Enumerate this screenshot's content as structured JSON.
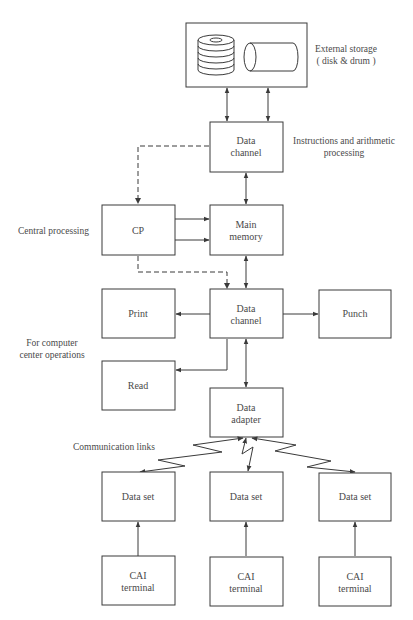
{
  "diagram": {
    "colors": {
      "stroke": "#3a3a3a",
      "text": "#4a4a4a",
      "background": "#ffffff"
    },
    "annotations": {
      "external_storage": [
        "External storage",
        "( disk & drum )"
      ],
      "instructions": [
        "Instructions and arithmetic",
        "processing"
      ],
      "central_processing": "Central processing",
      "computer_center": [
        "For computer",
        "center operations"
      ],
      "communication_links": "Communication links"
    },
    "nodes": {
      "storage": {
        "label": "External storage (disk & drum)"
      },
      "data_channel_top": {
        "line1": "Data",
        "line2": "channel"
      },
      "cp": {
        "label": "CP"
      },
      "main_memory": {
        "line1": "Main",
        "line2": "memory"
      },
      "print": {
        "label": "Print"
      },
      "data_channel_bottom": {
        "line1": "Data",
        "line2": "channel"
      },
      "punch": {
        "label": "Punch"
      },
      "read": {
        "label": "Read"
      },
      "data_adapter": {
        "line1": "Data",
        "line2": "adapter"
      },
      "data_sets": [
        {
          "label": "Data set"
        },
        {
          "label": "Data set"
        },
        {
          "label": "Data set"
        }
      ],
      "terminals": [
        {
          "line1": "CAI",
          "line2": "terminal"
        },
        {
          "line1": "CAI",
          "line2": "terminal"
        },
        {
          "line1": "CAI",
          "line2": "terminal"
        }
      ]
    },
    "edges": [
      {
        "from": "storage",
        "to": "data_channel_top",
        "type": "bidirectional",
        "count": 2
      },
      {
        "from": "data_channel_top",
        "to": "cp",
        "type": "dashed"
      },
      {
        "from": "data_channel_top",
        "to": "main_memory",
        "type": "bidirectional"
      },
      {
        "from": "cp",
        "to": "main_memory",
        "type": "arrow",
        "count": 2
      },
      {
        "from": "cp",
        "to": "data_channel_bottom",
        "type": "dashed"
      },
      {
        "from": "main_memory",
        "to": "data_channel_bottom",
        "type": "bidirectional"
      },
      {
        "from": "data_channel_bottom",
        "to": "print",
        "type": "arrow"
      },
      {
        "from": "data_channel_bottom",
        "to": "punch",
        "type": "arrow"
      },
      {
        "from": "data_channel_bottom",
        "to": "read",
        "type": "arrow"
      },
      {
        "from": "data_channel_bottom",
        "to": "data_adapter",
        "type": "bidirectional"
      },
      {
        "from": "data_adapter",
        "to": "data_sets",
        "type": "communication-link",
        "count": 3
      },
      {
        "from": "terminals",
        "to": "data_sets",
        "type": "arrow",
        "count": 3
      }
    ]
  }
}
